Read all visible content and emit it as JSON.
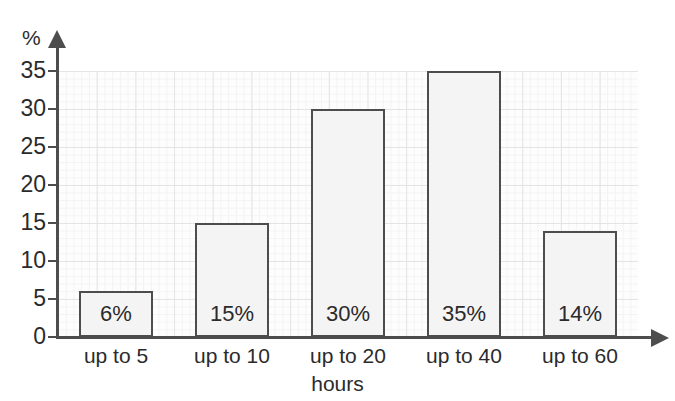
{
  "chart_data": {
    "type": "bar",
    "title": "",
    "subtitle": "",
    "xlabel": "hours",
    "ylabel": "%",
    "categories": [
      "up to 5",
      "up to 10",
      "up to 20",
      "up to 40",
      "up to 60"
    ],
    "values": [
      6,
      15,
      30,
      35,
      14
    ],
    "data_labels": [
      "6%",
      "15%",
      "30%",
      "35%",
      "14%"
    ],
    "ylim": [
      0,
      35
    ],
    "ytick_values": [
      0,
      5,
      10,
      15,
      20,
      25,
      30,
      35
    ],
    "ytick_labels": [
      "0",
      "5",
      "10",
      "15",
      "20",
      "25",
      "30",
      "35"
    ],
    "grid": true,
    "legend": false,
    "legend_position": "none",
    "colors": {
      "bar_fill": "#f4f4f4",
      "bar_border": "#4d4d4d",
      "axis": "#4d4d4d",
      "grid_major": "#d9d9d9",
      "grid_minor": "#f0f0f0",
      "text": "#2b2b2b",
      "background": "#ffffff"
    }
  },
  "axes": {
    "y_unit_label": "%",
    "x_title": "hours"
  }
}
